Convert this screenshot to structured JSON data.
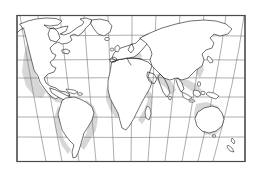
{
  "figure": {
    "kind": "world-map",
    "title": "",
    "caption": "",
    "width_px": 262,
    "height_px": 175
  },
  "style": {
    "background_color": "#ffffff",
    "frame_color": "#4a4a4a",
    "graticule_color": "#6b6b6b",
    "coastline_color": "#1a1a1a",
    "landmass_fill": "#ffffff",
    "continental_shelf_color": "#c9c9c9"
  },
  "frame": {
    "x": 17,
    "y": 15.5,
    "width": 228,
    "height": 146
  },
  "projection": {
    "name": "pseudocylindrical",
    "description": "curved meridians converging at poles, straight horizontal parallels",
    "meridian_count": 12,
    "parallel_count": 6,
    "meridian_spacing_degrees": 30,
    "parallel_spacing_degrees": 30,
    "central_meridian_degrees": 10
  },
  "graticule": {
    "parallels_y": [
      36,
      60,
      78,
      97,
      117,
      137
    ],
    "meridian_top_x": [
      20,
      38,
      60,
      84,
      108,
      132,
      156,
      180,
      204,
      226,
      242
    ],
    "meridian_bottom_x": [
      46,
      62,
      79,
      96,
      114,
      131,
      148,
      165,
      182,
      198,
      213
    ]
  },
  "landmasses": [
    {
      "name": "north-america",
      "label": "North America"
    },
    {
      "name": "greenland",
      "label": "Greenland"
    },
    {
      "name": "south-america",
      "label": "South America"
    },
    {
      "name": "africa",
      "label": "Africa"
    },
    {
      "name": "europe",
      "label": "Europe"
    },
    {
      "name": "asia",
      "label": "Asia"
    },
    {
      "name": "australia",
      "label": "Australia"
    },
    {
      "name": "new-zealand",
      "label": "New Zealand"
    },
    {
      "name": "madagascar",
      "label": "Madagascar"
    },
    {
      "name": "japan",
      "label": "Japan"
    },
    {
      "name": "british-isles",
      "label": "British Isles"
    },
    {
      "name": "indonesia",
      "label": "Indonesia"
    },
    {
      "name": "iceland",
      "label": "Iceland"
    },
    {
      "name": "cuba-caribbean",
      "label": "Caribbean Islands"
    },
    {
      "name": "sri-lanka",
      "label": "Sri Lanka"
    },
    {
      "name": "philippines",
      "label": "Philippines"
    },
    {
      "name": "new-guinea",
      "label": "New Guinea"
    }
  ],
  "annotations": []
}
